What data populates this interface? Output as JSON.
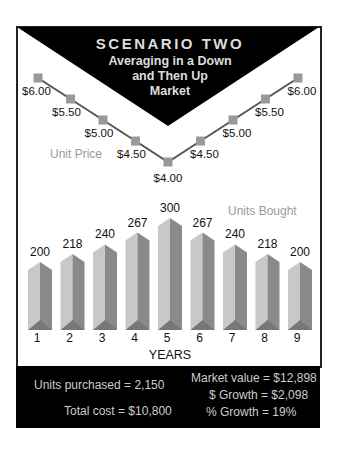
{
  "title": {
    "main": "SCENARIO TWO",
    "sub": [
      "Averaging in a Down",
      "and Then Up",
      "Market"
    ]
  },
  "labels": {
    "unit_price": "Unit Price",
    "units_bought": "Units Bought",
    "xlabel": "YEARS"
  },
  "colors": {
    "frame": "#222222",
    "line": "#555555",
    "marker": "#999999",
    "bar_light": "#c8c8c8",
    "bar_dark": "#8a8a8a",
    "label_gray": "#9a9a9a",
    "footer_bg": "#000000",
    "footer_text": "#cccccc"
  },
  "footer": {
    "units_purchased": "Units purchased = 2,150",
    "total_cost": "Total cost = $10,800",
    "market_value": "Market value = $12,898",
    "dollar_growth": "$ Growth = $2,098",
    "percent_growth": "% Growth = 19%"
  },
  "chart_data": [
    {
      "type": "line",
      "title": "Unit Price",
      "x": [
        1,
        2,
        3,
        4,
        5,
        6,
        7,
        8,
        9
      ],
      "values": [
        6.0,
        5.5,
        5.0,
        4.5,
        4.0,
        4.5,
        5.0,
        5.5,
        6.0
      ],
      "value_labels": [
        "$6.00",
        "$5.50",
        "$5.00",
        "$4.50",
        "$4.00",
        "$4.50",
        "$5.00",
        "$5.50",
        "$6.00"
      ]
    },
    {
      "type": "bar",
      "title": "Units Bought",
      "categories": [
        "1",
        "2",
        "3",
        "4",
        "5",
        "6",
        "7",
        "8",
        "9"
      ],
      "values": [
        200,
        218,
        240,
        267,
        300,
        267,
        240,
        218,
        200
      ],
      "xlabel": "YEARS",
      "ylabel": ""
    }
  ]
}
